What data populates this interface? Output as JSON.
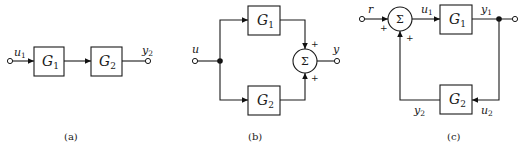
{
  "diagrams": {
    "a": {
      "caption": "(a)",
      "title": "series connection",
      "input_label": "u",
      "input_sub": "1",
      "output_label": "y",
      "output_sub": "2",
      "blocks": [
        {
          "name": "G",
          "sub": "1"
        },
        {
          "name": "G",
          "sub": "2"
        }
      ]
    },
    "b": {
      "caption": "(b)",
      "title": "parallel connection",
      "input_label": "u",
      "output_label": "y",
      "summer_symbol": "Σ",
      "summer_signs": [
        "+",
        "+"
      ],
      "blocks": [
        {
          "name": "G",
          "sub": "1"
        },
        {
          "name": "G",
          "sub": "2"
        }
      ]
    },
    "c": {
      "caption": "(c)",
      "title": "feedback connection",
      "input_label": "r",
      "summer_symbol": "Σ",
      "summer_signs": [
        "+",
        "+"
      ],
      "signals": {
        "u1": {
          "label": "u",
          "sub": "1"
        },
        "y1": {
          "label": "y",
          "sub": "1"
        },
        "u2": {
          "label": "u",
          "sub": "2"
        },
        "y2": {
          "label": "y",
          "sub": "2"
        }
      },
      "blocks": [
        {
          "name": "G",
          "sub": "1"
        },
        {
          "name": "G",
          "sub": "2"
        }
      ]
    }
  }
}
